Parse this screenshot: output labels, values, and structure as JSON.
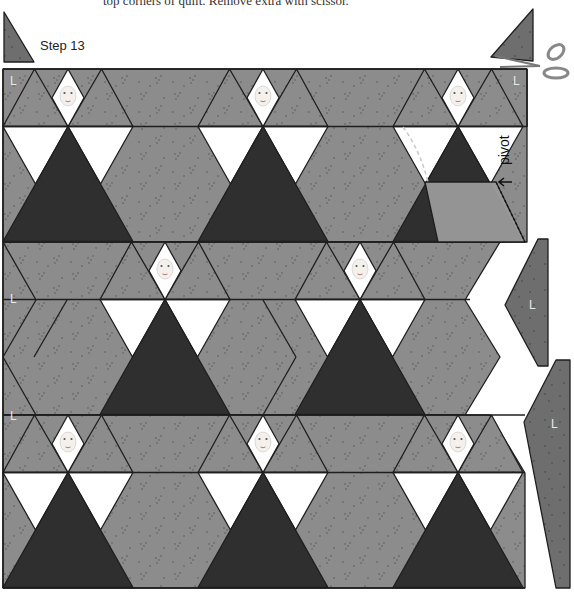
{
  "caption": "top corners of quilt. Remove extra with scissor.",
  "step_label": "Step 13",
  "pivot_label": "pivot",
  "piece_label": "L",
  "colors": {
    "fabric": "#8c8c8c",
    "fabric_dark": "#7a7a7a",
    "skirt": "#2f2f2f",
    "white": "#ffffff",
    "line": "#1e1e1e",
    "fold": "#9a9a9a"
  },
  "figures": {
    "row_a_faces": 3,
    "row_b_faces": 2,
    "row_c_faces": 3
  },
  "loose_pieces": [
    "L",
    "L",
    "L",
    "L",
    "L"
  ]
}
